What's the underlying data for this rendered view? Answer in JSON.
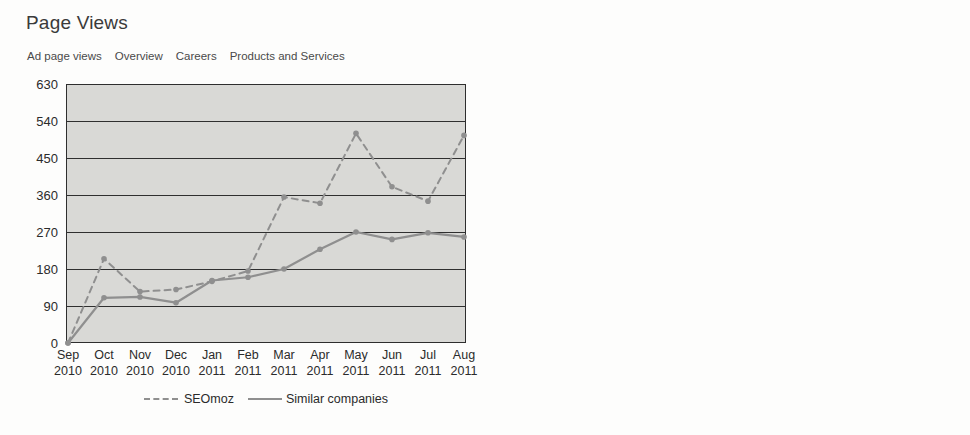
{
  "page": {
    "background": "#fdfdfc",
    "plot_background": "#d9d9d6",
    "line_color": "#8f8f8f",
    "axis_color": "#2e2e2e"
  },
  "legend": {
    "seomoz_label": "SEOmoz",
    "similar_label": "Similar companies"
  },
  "nav": {
    "items": [
      {
        "label": "Ad page views"
      },
      {
        "label": "Overview"
      },
      {
        "label": "Careers"
      },
      {
        "label": "Products and Services"
      }
    ]
  },
  "panels": [
    {
      "title": "Page Views"
    },
    {
      "title": "Unique Vistors"
    }
  ],
  "chart_data": [
    {
      "type": "line",
      "title": "Page Views",
      "xlabel": "",
      "ylabel": "",
      "ylim": [
        0,
        630
      ],
      "yticks": [
        0,
        90,
        180,
        270,
        360,
        450,
        540,
        630
      ],
      "ytick_labels": [
        "0",
        "90",
        "180",
        "270",
        "360",
        "450",
        "540",
        "630"
      ],
      "grid": true,
      "legend_position": "bottom",
      "categories": [
        "Sep 2010",
        "Oct 2010",
        "Nov 2010",
        "Dec 2010",
        "Jan 2011",
        "Feb 2011",
        "Mar 2011",
        "Apr 2011",
        "May 2011",
        "Jun 2011",
        "Jul 2011",
        "Aug 2011"
      ],
      "x_month_labels": [
        "Sep",
        "Oct",
        "Nov",
        "Dec",
        "Jan",
        "Feb",
        "Mar",
        "Apr",
        "May",
        "Jun",
        "Jul",
        "Aug"
      ],
      "x_year_labels": [
        "2010",
        "2010",
        "2010",
        "2010",
        "2011",
        "2011",
        "2011",
        "2011",
        "2011",
        "2011",
        "2011",
        "2011"
      ],
      "series": [
        {
          "name": "SEOmoz",
          "style": "dashed",
          "values": [
            0,
            205,
            125,
            130,
            150,
            175,
            355,
            340,
            510,
            380,
            345,
            505
          ]
        },
        {
          "name": "Similar companies",
          "style": "solid",
          "values": [
            0,
            110,
            112,
            98,
            152,
            160,
            180,
            228,
            270,
            252,
            268,
            258
          ]
        }
      ]
    },
    {
      "type": "line",
      "title": "Unique Vistors",
      "xlabel": "",
      "ylabel": "",
      "ylim": [
        0,
        420
      ],
      "yticks": [
        0,
        60,
        120,
        180,
        240,
        300,
        360,
        420
      ],
      "ytick_labels": [
        "0",
        "60",
        "120",
        "180",
        "240",
        "300",
        "360",
        "420"
      ],
      "grid": true,
      "legend_position": "bottom",
      "categories": [
        "Sep 2010",
        "Oct 2010",
        "Nov 2010",
        "Dec 2010",
        "Jan 2011",
        "Feb 2011",
        "Mar 2011",
        "Apr 2011",
        "May 2011",
        "Jun 2011",
        "Jul 2011",
        "Aug 2011"
      ],
      "x_month_labels": [
        "Sep",
        "Oct",
        "Nov",
        "Dec",
        "Jan",
        "Feb",
        "Mar",
        "Apr",
        "May",
        "Jun",
        "Jul",
        "Aug"
      ],
      "x_year_labels": [
        "2010",
        "2010",
        "2010",
        "2010",
        "2011",
        "2011",
        "2011",
        "2011",
        "2011",
        "2011",
        "2011",
        "2011"
      ],
      "series": [
        {
          "name": "SEOmoz",
          "style": "dashed",
          "values": [
            0,
            120,
            91,
            108,
            160,
            163,
            222,
            195,
            291,
            272,
            232,
            312
          ]
        },
        {
          "name": "Similar companies",
          "style": "solid",
          "values": [
            0,
            68,
            73,
            66,
            100,
            100,
            124,
            128,
            160,
            150,
            143,
            155
          ]
        }
      ]
    }
  ]
}
